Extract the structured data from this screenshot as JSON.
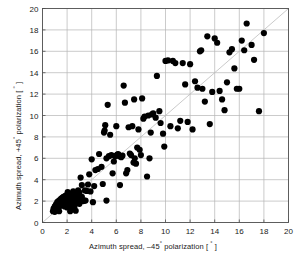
{
  "chart_data": {
    "type": "scatter",
    "title": "",
    "xlabel": "Azimuth spread, -45° polarization [ ° ]",
    "ylabel": "Azimuth spread, +45° polarization [ ° ]",
    "xlabel_parts": {
      "pre": "Azimuth spread, –45",
      "sup1": "°",
      "mid": " polarization [ ",
      "sup2": "°",
      "post": " ]"
    },
    "ylabel_parts": {
      "pre": "Azimuth spread, +45",
      "sup1": "°",
      "mid": " polarization [ ",
      "sup2": "°",
      "post": " ]"
    },
    "xlim": [
      0,
      20
    ],
    "ylim": [
      0,
      20
    ],
    "xticks": [
      0,
      2,
      4,
      6,
      8,
      10,
      12,
      14,
      16,
      18,
      20
    ],
    "yticks": [
      0,
      2,
      4,
      6,
      8,
      10,
      12,
      14,
      16,
      18,
      20
    ],
    "xticklabels": [
      "0",
      "2",
      "4",
      "6",
      "8",
      "10",
      "12",
      "14",
      "16",
      "18",
      "20"
    ],
    "yticklabels": [
      "0",
      "2",
      "4",
      "6",
      "8",
      "10",
      "12",
      "14",
      "16",
      "18",
      "20"
    ],
    "grid": true,
    "grid_color": "#b4b4b4",
    "axis_color": "#4d4d4d",
    "marker_color": "#000000",
    "marker_size": 3.1,
    "legend": "none",
    "reference_line": {
      "type": "identity",
      "from": [
        0,
        0
      ],
      "to": [
        20,
        20
      ],
      "color": "#bdbdbd",
      "label": "y = x"
    },
    "points": [
      [
        0.9,
        1.3
      ],
      [
        0.95,
        1.15
      ],
      [
        1.0,
        1.5
      ],
      [
        1.0,
        1.0
      ],
      [
        1.05,
        1.35
      ],
      [
        1.1,
        1.7
      ],
      [
        1.1,
        1.2
      ],
      [
        1.15,
        1.55
      ],
      [
        1.2,
        1.9
      ],
      [
        1.2,
        1.3
      ],
      [
        1.25,
        1.6
      ],
      [
        1.3,
        2.0
      ],
      [
        1.3,
        1.45
      ],
      [
        1.35,
        1.75
      ],
      [
        1.4,
        2.1
      ],
      [
        1.4,
        1.55
      ],
      [
        1.45,
        1.85
      ],
      [
        1.5,
        2.2
      ],
      [
        1.5,
        1.6
      ],
      [
        1.55,
        1.95
      ],
      [
        1.6,
        2.3
      ],
      [
        1.6,
        1.7
      ],
      [
        1.65,
        2.05
      ],
      [
        1.7,
        2.4
      ],
      [
        1.7,
        1.8
      ],
      [
        1.75,
        2.15
      ],
      [
        1.8,
        1.5
      ],
      [
        1.8,
        1.95
      ],
      [
        1.85,
        2.5
      ],
      [
        1.9,
        1.65
      ],
      [
        1.9,
        2.25
      ],
      [
        1.95,
        1.85
      ],
      [
        2.0,
        2.6
      ],
      [
        2.0,
        1.4
      ],
      [
        2.05,
        2.05
      ],
      [
        2.1,
        1.7
      ],
      [
        2.1,
        2.35
      ],
      [
        2.15,
        1.95
      ],
      [
        2.2,
        2.7
      ],
      [
        2.2,
        1.55
      ],
      [
        2.25,
        2.15
      ],
      [
        2.3,
        1.8
      ],
      [
        2.3,
        2.45
      ],
      [
        2.35,
        2.0
      ],
      [
        2.4,
        1.3
      ],
      [
        2.4,
        2.6
      ],
      [
        2.45,
        2.2
      ],
      [
        2.5,
        1.7
      ],
      [
        2.5,
        2.9
      ],
      [
        2.55,
        2.05
      ],
      [
        2.6,
        1.5
      ],
      [
        2.6,
        2.4
      ],
      [
        2.7,
        1.1
      ],
      [
        2.7,
        2.75
      ],
      [
        2.8,
        1.9
      ],
      [
        2.85,
        2.55
      ],
      [
        2.9,
        3.0
      ],
      [
        2.95,
        2.25
      ],
      [
        3.0,
        1.75
      ],
      [
        3.0,
        2.8
      ],
      [
        3.1,
        4.2
      ],
      [
        3.2,
        2.4
      ],
      [
        3.2,
        3.5
      ],
      [
        3.3,
        2.0
      ],
      [
        3.4,
        2.05
      ],
      [
        3.45,
        3.0
      ],
      [
        3.5,
        2.05
      ],
      [
        3.6,
        2.95
      ],
      [
        3.7,
        3.55
      ],
      [
        3.8,
        4.5
      ],
      [
        4.0,
        5.9
      ],
      [
        4.2,
        3.4
      ],
      [
        4.3,
        4.9
      ],
      [
        4.5,
        5.0
      ],
      [
        4.6,
        6.4
      ],
      [
        4.8,
        5.2
      ],
      [
        5.0,
        8.4
      ],
      [
        5.05,
        8.6
      ],
      [
        5.1,
        9.1
      ],
      [
        5.2,
        6.0
      ],
      [
        5.3,
        11.0
      ],
      [
        5.4,
        6.2
      ],
      [
        5.5,
        8.2
      ],
      [
        5.6,
        6.3
      ],
      [
        5.7,
        4.6
      ],
      [
        5.8,
        5.7
      ],
      [
        5.9,
        6.2
      ],
      [
        6.0,
        9.0
      ],
      [
        6.05,
        6.3
      ],
      [
        6.1,
        6.35
      ],
      [
        6.15,
        6.4
      ],
      [
        6.2,
        6.3
      ],
      [
        6.25,
        6.2
      ],
      [
        6.3,
        3.5
      ],
      [
        6.4,
        6.1
      ],
      [
        6.5,
        6.25
      ],
      [
        6.6,
        12.8
      ],
      [
        6.7,
        11.2
      ],
      [
        6.8,
        4.6
      ],
      [
        7.0,
        8.9
      ],
      [
        7.1,
        6.45
      ],
      [
        7.2,
        6.3
      ],
      [
        7.3,
        9.0
      ],
      [
        7.4,
        5.6
      ],
      [
        7.5,
        6.0
      ],
      [
        7.6,
        5.5
      ],
      [
        7.7,
        7.0
      ],
      [
        7.8,
        8.7
      ],
      [
        7.9,
        6.8
      ],
      [
        8.0,
        6.3
      ],
      [
        8.2,
        9.7
      ],
      [
        8.3,
        9.9
      ],
      [
        8.5,
        4.3
      ],
      [
        8.6,
        10.0
      ],
      [
        8.7,
        6.0
      ],
      [
        8.8,
        8.4
      ],
      [
        8.9,
        10.1
      ],
      [
        9.0,
        10.2
      ],
      [
        9.2,
        9.8
      ],
      [
        9.3,
        13.7
      ],
      [
        9.5,
        10.4
      ],
      [
        9.6,
        9.3
      ],
      [
        9.8,
        8.3
      ],
      [
        10.0,
        15.1
      ],
      [
        10.2,
        15.15
      ],
      [
        10.4,
        9.0
      ],
      [
        10.6,
        15.1
      ],
      [
        10.8,
        14.9
      ],
      [
        11.0,
        8.8
      ],
      [
        11.2,
        9.5
      ],
      [
        11.4,
        14.9
      ],
      [
        11.6,
        12.9
      ],
      [
        11.8,
        9.4
      ],
      [
        12.0,
        14.8
      ],
      [
        12.2,
        8.7
      ],
      [
        12.4,
        13.2
      ],
      [
        12.6,
        12.6
      ],
      [
        12.8,
        16.0
      ],
      [
        13.0,
        12.5
      ],
      [
        13.2,
        11.3
      ],
      [
        13.4,
        17.4
      ],
      [
        13.6,
        9.2
      ],
      [
        13.8,
        12.2
      ],
      [
        14.0,
        17.2
      ],
      [
        14.2,
        16.8
      ],
      [
        14.4,
        12.3
      ],
      [
        14.6,
        11.5
      ],
      [
        14.8,
        10.5
      ],
      [
        15.0,
        13.1
      ],
      [
        15.2,
        15.9
      ],
      [
        15.4,
        16.2
      ],
      [
        15.6,
        14.4
      ],
      [
        15.8,
        12.5
      ],
      [
        16.0,
        12.5
      ],
      [
        16.2,
        17.0
      ],
      [
        16.4,
        16.1
      ],
      [
        16.6,
        18.6
      ],
      [
        17.0,
        16.6
      ],
      [
        17.2,
        15.2
      ],
      [
        17.6,
        10.4
      ],
      [
        18.0,
        17.7
      ],
      [
        5.2,
        2.05
      ],
      [
        4.9,
        3.6
      ],
      [
        4.1,
        1.9
      ],
      [
        3.9,
        2.9
      ],
      [
        6.9,
        4.9
      ],
      [
        9.9,
        7.1
      ],
      [
        8.1,
        11.6
      ],
      [
        7.45,
        11.5
      ],
      [
        12.9,
        16.1
      ],
      [
        2.25,
        1.05
      ],
      [
        1.35,
        1.05
      ],
      [
        2.05,
        2.85
      ],
      [
        0.85,
        1.05
      ],
      [
        3.15,
        2.2
      ]
    ]
  }
}
